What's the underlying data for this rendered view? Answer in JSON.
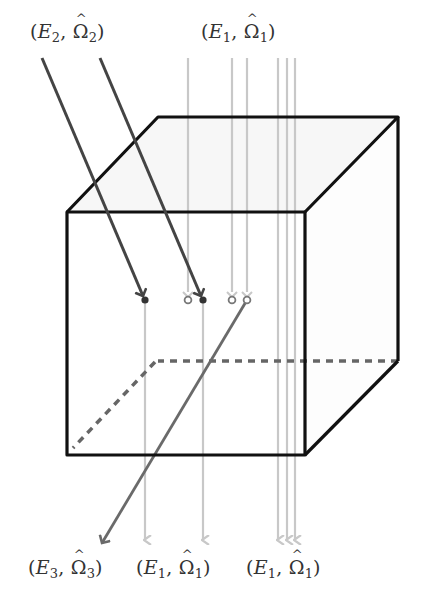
{
  "diagram": {
    "type": "scattering-cube",
    "colors": {
      "cube_edge": "#111111",
      "hidden_edge": "#666666",
      "top_face_fill": "#f6f6f6",
      "primary_beam": "#c8c8c8",
      "incoming_beam": "#444444",
      "scattered_beam": "#6a6a6a",
      "label": "#333333"
    },
    "labels": {
      "incoming_e2": {
        "E": "E",
        "sub": "2",
        "Omega": "Ω",
        "osub": "2"
      },
      "incoming_e1": {
        "E": "E",
        "sub": "1",
        "Omega": "Ω",
        "osub": "1"
      },
      "outgoing_e3": {
        "E": "E",
        "sub": "3",
        "Omega": "Ω",
        "osub": "3"
      },
      "outgoing_e1_left": {
        "E": "E",
        "sub": "1",
        "Omega": "Ω",
        "osub": "1"
      },
      "outgoing_e1_right": {
        "E": "E",
        "sub": "1",
        "Omega": "Ω",
        "osub": "1"
      }
    },
    "label_text": {
      "incoming_e2": "(E2, Ω̂2)",
      "incoming_e1": "(E1, Ω̂1)",
      "outgoing_e3": "(E3, Ω̂3)",
      "outgoing_e1_left": "(E1, Ω̂1)",
      "outgoing_e1_right": "(E1, Ω̂1)"
    },
    "interaction_points": [
      {
        "x": 145,
        "type": "absorbed-dark"
      },
      {
        "x": 188,
        "type": "scatter-hollow"
      },
      {
        "x": 203,
        "type": "absorbed-dark"
      },
      {
        "x": 232,
        "type": "scatter-hollow"
      },
      {
        "x": 247,
        "type": "scatter-hollow"
      }
    ]
  }
}
